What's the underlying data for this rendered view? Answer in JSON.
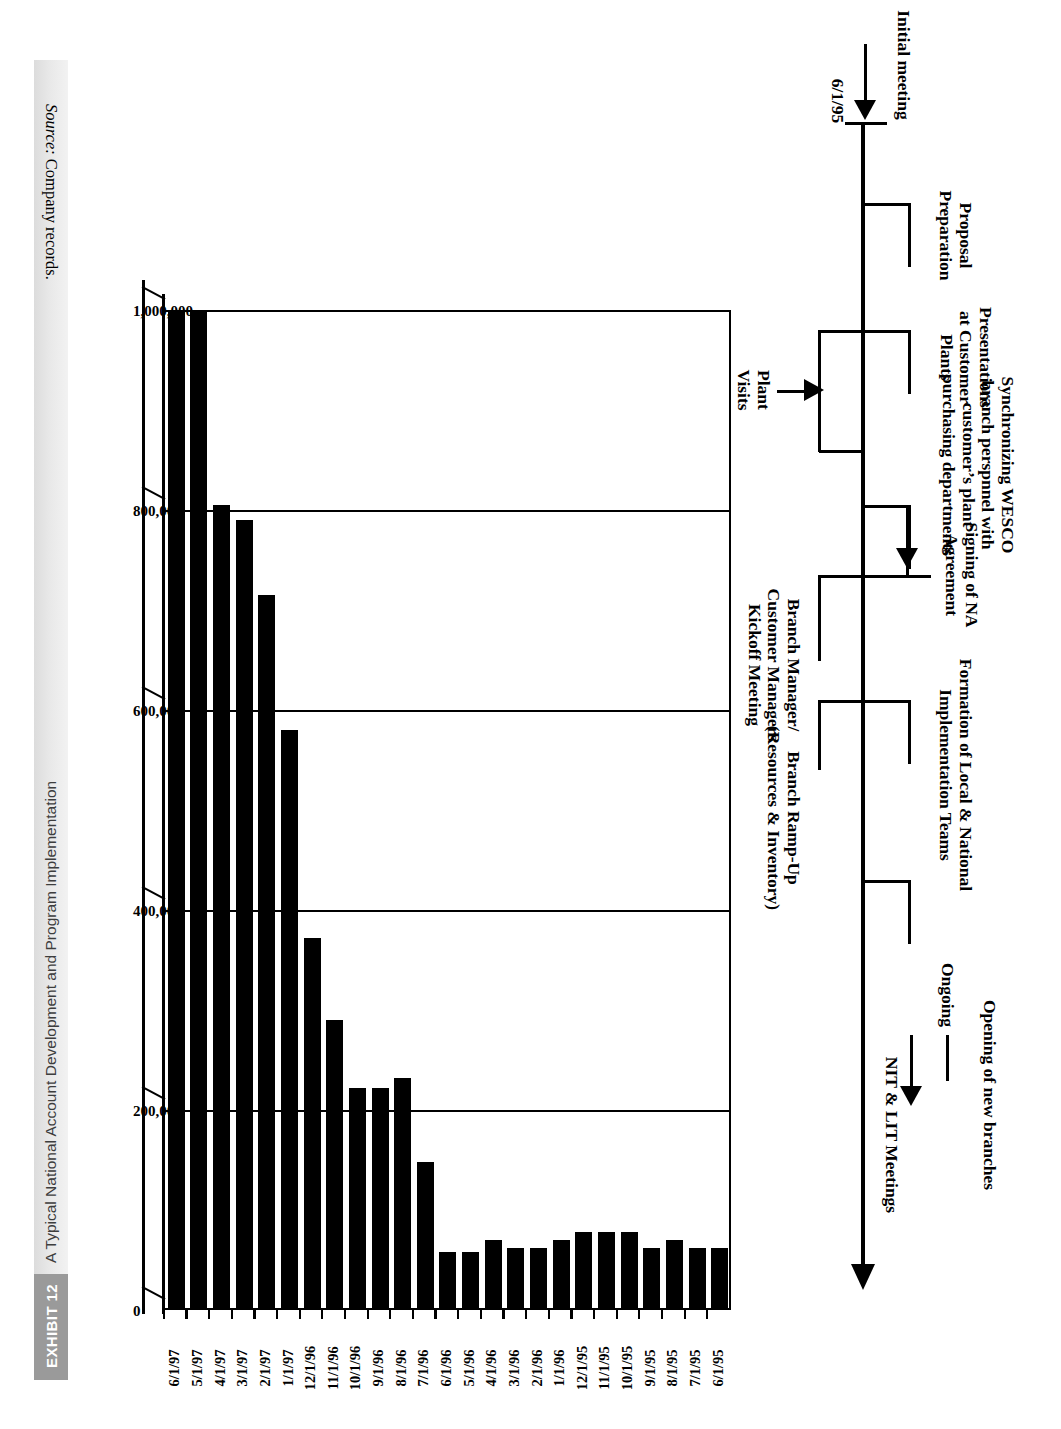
{
  "exhibit": {
    "tag": "EXHIBIT 12",
    "title": "A Typical National Account Development and Program Implementation"
  },
  "timeline": {
    "start_date": "6/1/95",
    "initial_marker": "Initial meeting",
    "signing_marker": "Signing of NA\nAgreement",
    "end_marker": "Opening of new branches",
    "milestones_above": [
      {
        "label": "Proposal\nPreparation"
      },
      {
        "label": "Presentations\nat Customer\nPlants"
      },
      {
        "label": "Synchronizing WESCO\nbranch perspnnel with\ncustomer’s plant\npurchasing departments"
      },
      {
        "label": "Formation of Local & National\nImplementation Teams"
      },
      {
        "label": "Ongoing"
      }
    ],
    "milestones_below": [
      {
        "label": "Plant\nVisits"
      },
      {
        "label": "Branch Manager/\nCustomer Managers\nKickoff Meeting"
      },
      {
        "label": "Branch Ramp-Up\n(Resources & Inventory)"
      },
      {
        "label": "NIT & LIT Meetings"
      }
    ]
  },
  "chart_data": {
    "type": "bar",
    "title": "",
    "xlabel": "",
    "ylabel": "",
    "orientation": "vertical",
    "grid": true,
    "legend": "none",
    "ylim": [
      0,
      1000000
    ],
    "yticks": [
      0,
      200000,
      400000,
      600000,
      800000,
      1000000
    ],
    "ytick_labels": [
      "0",
      "200,000",
      "400,000",
      "600,000",
      "800,000",
      "1,000,000"
    ],
    "categories": [
      "6/1/95",
      "7/1/95",
      "8/1/95",
      "9/1/95",
      "10/1/95",
      "11/1/95",
      "12/1/95",
      "1/1/96",
      "2/1/96",
      "3/1/96",
      "4/1/96",
      "5/1/96",
      "6/1/96",
      "7/1/96",
      "8/1/96",
      "9/1/96",
      "10/1/96",
      "11/1/96",
      "12/1/96",
      "1/1/97",
      "2/1/97",
      "3/1/97",
      "4/1/97",
      "5/1/97",
      "6/1/97"
    ],
    "values": [
      62000,
      62000,
      70000,
      62000,
      78000,
      78000,
      78000,
      70000,
      62000,
      62000,
      70000,
      58000,
      58000,
      148000,
      232000,
      222000,
      222000,
      290000,
      372000,
      580000,
      715000,
      790000,
      805000,
      1000000,
      1000000
    ]
  },
  "source": {
    "prefix": "Source:",
    "text": " Company records."
  }
}
